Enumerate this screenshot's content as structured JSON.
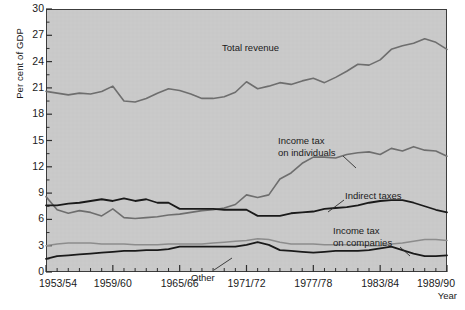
{
  "chart_data": {
    "type": "line",
    "title": "",
    "xlabel": "Year",
    "ylabel": "Per cent of GDP",
    "ylim": [
      0,
      30
    ],
    "yticks": [
      0,
      3,
      6,
      9,
      12,
      15,
      18,
      21,
      24,
      27,
      30
    ],
    "ytick_labels": [
      "0",
      "3",
      "6",
      "9",
      "12",
      "15",
      "18",
      "21",
      "24",
      "27",
      "30"
    ],
    "grid": false,
    "legend_position": "inline-annotations",
    "plot_background": "#c9c9c9",
    "x": [
      "1953/54",
      "1954/55",
      "1955/56",
      "1956/57",
      "1957/58",
      "1958/59",
      "1959/60",
      "1960/61",
      "1961/62",
      "1962/63",
      "1963/64",
      "1964/65",
      "1965/66",
      "1966/67",
      "1967/68",
      "1968/69",
      "1969/70",
      "1970/71",
      "1971/72",
      "1972/73",
      "1973/74",
      "1974/75",
      "1975/76",
      "1976/77",
      "1977/78",
      "1978/79",
      "1979/80",
      "1980/81",
      "1981/82",
      "1982/83",
      "1983/84",
      "1984/85",
      "1985/86",
      "1986/87",
      "1987/88",
      "1988/89",
      "1989/90"
    ],
    "xtick_labels": [
      "1953/54",
      "1959/60",
      "1965/66",
      "1971/72",
      "1977/78",
      "1983/84",
      "1989/90"
    ],
    "xtick_label_indices": [
      0,
      6,
      12,
      18,
      24,
      30,
      36
    ],
    "series": [
      {
        "name": "Total revenue",
        "color": "#6e6e6e",
        "width": 1.6,
        "label_x": "1970/71",
        "values": [
          20.6,
          20.4,
          20.2,
          20.4,
          20.3,
          20.6,
          21.2,
          19.5,
          19.4,
          19.8,
          20.4,
          20.9,
          20.7,
          20.3,
          19.8,
          19.8,
          20.0,
          20.5,
          21.7,
          20.9,
          21.2,
          21.6,
          21.4,
          21.8,
          22.1,
          21.6,
          22.2,
          22.9,
          23.7,
          23.6,
          24.2,
          25.4,
          25.8,
          26.1,
          26.6,
          26.2,
          25.4
        ]
      },
      {
        "name": "Income tax on individuals",
        "color": "#6e6e6e",
        "width": 1.6,
        "label_x": "1976/77",
        "values": [
          8.6,
          7.1,
          6.7,
          7.0,
          6.8,
          6.4,
          7.2,
          6.2,
          6.1,
          6.2,
          6.3,
          6.5,
          6.6,
          6.8,
          7.0,
          7.1,
          7.3,
          7.7,
          8.8,
          8.5,
          8.8,
          10.6,
          11.3,
          12.4,
          13.1,
          13.1,
          13.0,
          13.4,
          13.6,
          13.7,
          13.4,
          14.1,
          13.8,
          14.3,
          13.9,
          13.8,
          13.2
        ]
      },
      {
        "name": "Indirect taxes",
        "color": "#1a1a1a",
        "width": 1.8,
        "label_x": "1978/79",
        "values": [
          7.6,
          7.6,
          7.8,
          7.9,
          8.1,
          8.3,
          8.1,
          8.4,
          8.1,
          8.3,
          7.9,
          7.9,
          7.2,
          7.2,
          7.2,
          7.2,
          7.1,
          7.1,
          7.1,
          6.4,
          6.4,
          6.4,
          6.7,
          6.8,
          6.9,
          7.2,
          7.3,
          7.4,
          7.6,
          7.9,
          8.1,
          8.2,
          8.2,
          7.9,
          7.5,
          7.1,
          6.8
        ]
      },
      {
        "name": "Income tax on companies",
        "color": "#8c8c8c",
        "width": 1.5,
        "label_x": "1979/80",
        "values": [
          3.0,
          3.2,
          3.3,
          3.3,
          3.3,
          3.2,
          3.2,
          3.2,
          3.1,
          3.1,
          3.1,
          3.2,
          3.2,
          3.2,
          3.2,
          3.3,
          3.4,
          3.5,
          3.6,
          3.8,
          3.7,
          3.4,
          3.2,
          3.2,
          3.2,
          3.1,
          3.1,
          3.1,
          3.1,
          3.0,
          3.0,
          3.2,
          3.3,
          3.5,
          3.7,
          3.7,
          3.6
        ]
      },
      {
        "name": "Other",
        "color": "#1a1a1a",
        "width": 1.8,
        "label_x": "1968/69",
        "values": [
          1.5,
          1.8,
          1.9,
          2.0,
          2.1,
          2.2,
          2.3,
          2.4,
          2.4,
          2.5,
          2.5,
          2.6,
          2.9,
          2.9,
          2.9,
          2.9,
          2.9,
          2.9,
          3.1,
          3.4,
          3.1,
          2.5,
          2.4,
          2.3,
          2.2,
          2.3,
          2.4,
          2.4,
          2.4,
          2.5,
          2.7,
          2.9,
          2.5,
          2.1,
          1.8,
          1.8,
          1.9
        ]
      }
    ],
    "annotations": [
      {
        "name": "total-revenue",
        "text": "Total revenue",
        "text_lines": [
          "Total revenue"
        ],
        "x": 222,
        "y": 42,
        "leader": null
      },
      {
        "name": "income-tax-individuals",
        "text": "Income tax on individuals",
        "text_lines": [
          "Income tax",
          "on individuals"
        ],
        "x": 278,
        "y": 135,
        "leader": {
          "x1": 343,
          "y1": 156,
          "x2": 356,
          "y2": 168
        }
      },
      {
        "name": "indirect-taxes",
        "text": "Indirect taxes",
        "text_lines": [
          "Indirect taxes"
        ],
        "x": 345,
        "y": 190,
        "leader": {
          "x1": 344,
          "y1": 200,
          "x2": 328,
          "y2": 212
        }
      },
      {
        "name": "income-tax-companies",
        "text": "Income tax on companies",
        "text_lines": [
          "Income tax",
          "on companies"
        ],
        "x": 333,
        "y": 225,
        "leader": {
          "x1": 400,
          "y1": 247,
          "x2": 410,
          "y2": 256
        }
      },
      {
        "name": "other",
        "text": "Other",
        "text_lines": [
          "Other"
        ],
        "x": 191,
        "y": 272,
        "leader": {
          "x1": 214,
          "y1": 270,
          "x2": 232,
          "y2": 258
        }
      }
    ]
  }
}
